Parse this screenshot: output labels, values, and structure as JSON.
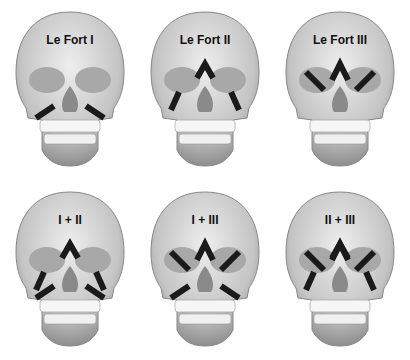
{
  "figure": {
    "panels": [
      {
        "label": "Le Fort I",
        "lines": [
          "I"
        ]
      },
      {
        "label": "Le Fort II",
        "lines": [
          "II"
        ]
      },
      {
        "label": "Le Fort III",
        "lines": [
          "III"
        ]
      },
      {
        "label": "I + II",
        "lines": [
          "I",
          "II"
        ]
      },
      {
        "label": "I + III",
        "lines": [
          "I",
          "III"
        ]
      },
      {
        "label": "II + III",
        "lines": [
          "II",
          "III"
        ]
      }
    ]
  },
  "colors": {
    "skull_fill": "#c9c9c9",
    "skull_light": "#e6e6e6",
    "socket": "#9a9a9a",
    "fracture_line": "#1a1a1a",
    "background": "#ffffff"
  }
}
